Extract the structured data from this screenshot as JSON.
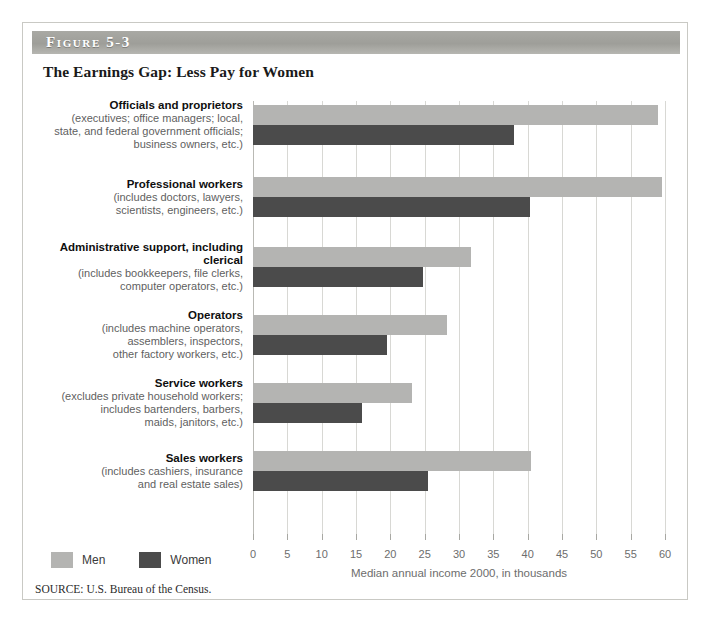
{
  "figure": {
    "band_label": "Figure 5-3",
    "title": "The Earnings Gap: Less Pay for Women",
    "source": "SOURCE: U.S. Bureau of the Census."
  },
  "legend": {
    "position": "bottom-left",
    "items": [
      {
        "label": "Men",
        "color": "#b4b4b2"
      },
      {
        "label": "Women",
        "color": "#4b4b4b"
      }
    ]
  },
  "colors": {
    "men_bar": "#b4b4b2",
    "women_bar": "#4b4b4b",
    "band": "#9e9e99",
    "gridline": "#d8d8d4",
    "card_border": "#c9c9c4"
  },
  "chart_data": {
    "type": "bar",
    "orientation": "horizontal",
    "title": "The Earnings Gap: Less Pay for Women",
    "xlabel": "Median annual income 2000, in thousands",
    "ylabel": "",
    "xlim": [
      0,
      60
    ],
    "xticks": [
      0,
      5,
      10,
      15,
      20,
      25,
      30,
      35,
      40,
      45,
      50,
      55,
      60
    ],
    "xtick_labels": [
      "0",
      "5",
      "10",
      "15",
      "20",
      "25",
      "30",
      "35",
      "40",
      "45",
      "50",
      "55",
      "60"
    ],
    "grid": true,
    "legend": [
      "Men",
      "Women"
    ],
    "categories": [
      {
        "name": "Officials and proprietors",
        "detail": "(executives; office managers; local,\nstate, and federal government officials;\nbusiness owners, etc.)"
      },
      {
        "name": "Professional workers",
        "detail": "(includes doctors, lawyers,\nscientists, engineers, etc.)"
      },
      {
        "name": "Administrative support,\nincluding clerical",
        "detail": "(includes bookkeepers, file clerks,\ncomputer operators, etc.)"
      },
      {
        "name": "Operators",
        "detail": "(includes machine operators,\nassemblers, inspectors,\nother factory workers, etc.)"
      },
      {
        "name": "Service workers",
        "detail": "(excludes private household workers;\nincludes bartenders, barbers,\nmaids, janitors, etc.)"
      },
      {
        "name": "Sales workers",
        "detail": "(includes cashiers, insurance\nand real estate sales)"
      }
    ],
    "series": [
      {
        "name": "Men",
        "color": "#b4b4b2",
        "values": [
          59.0,
          59.5,
          31.8,
          28.2,
          23.2,
          40.5
        ]
      },
      {
        "name": "Women",
        "color": "#4b4b4b",
        "values": [
          38.0,
          40.4,
          24.7,
          19.5,
          15.9,
          25.5
        ]
      }
    ]
  }
}
